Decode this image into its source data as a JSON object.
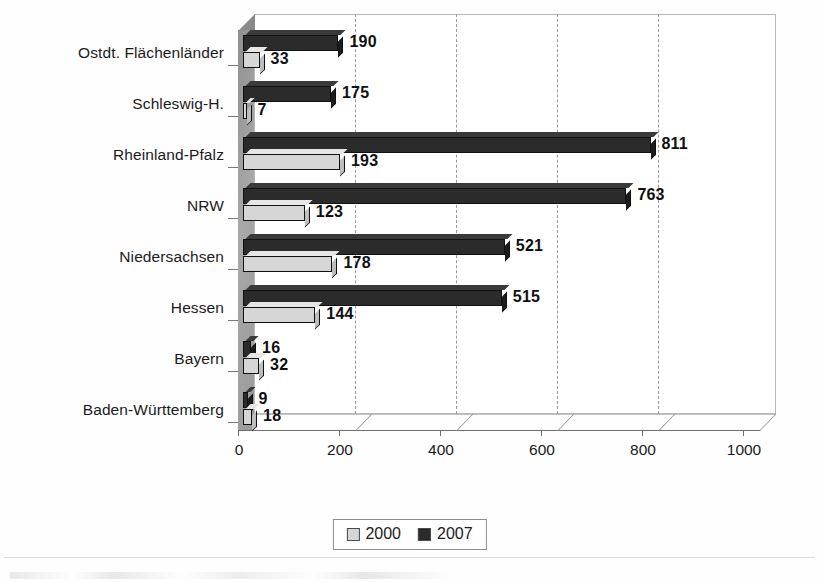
{
  "chart_data": {
    "type": "bar",
    "orientation": "horizontal",
    "title": "",
    "xlabel": "",
    "ylabel": "",
    "xlim": [
      0,
      1000
    ],
    "xticks": [
      "0",
      "200",
      "400",
      "600",
      "800",
      "1000"
    ],
    "grid": true,
    "legend_position": "bottom-center",
    "categories": [
      "Ostdt. Flächenländer",
      "Schleswig-H.",
      "Rheinland-Pfalz",
      "NRW",
      "Niedersachsen",
      "Hessen",
      "Bayern",
      "Baden-Württemberg"
    ],
    "series": [
      {
        "name": "2007",
        "color": "#2b2b2b",
        "values": [
          190,
          175,
          811,
          763,
          521,
          515,
          16,
          9
        ],
        "labels": [
          "190",
          "175",
          "811",
          "763",
          "521",
          "515",
          "16",
          "9"
        ]
      },
      {
        "name": "2000",
        "color": "#d6d6d6",
        "values": [
          33,
          7,
          193,
          123,
          178,
          144,
          32,
          18
        ],
        "labels": [
          "33",
          "7",
          "193",
          "123",
          "178",
          "144",
          "32",
          "18"
        ]
      }
    ]
  },
  "legend": {
    "items": [
      {
        "label": "2000",
        "color": "#d6d6d6"
      },
      {
        "label": "2007",
        "color": "#2b2b2b"
      }
    ]
  }
}
